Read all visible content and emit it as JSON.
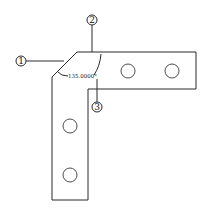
{
  "drawing": {
    "type": "L-bracket plate with chamfered outer corner",
    "dimension": {
      "label": "135.0000°",
      "kind": "angular"
    },
    "callouts": [
      {
        "id": "1",
        "label": "1",
        "target": "chamfer-edge"
      },
      {
        "id": "2",
        "label": "2",
        "target": "top-edge"
      },
      {
        "id": "3",
        "label": "3",
        "target": "angle-dimension"
      }
    ],
    "holes": [
      {
        "cx": 128,
        "cy": 71,
        "r": 7
      },
      {
        "cx": 172,
        "cy": 71,
        "r": 7
      },
      {
        "cx": 70,
        "cy": 126,
        "r": 7
      },
      {
        "cx": 70,
        "cy": 175,
        "r": 7
      }
    ],
    "colors": {
      "line": "#2a2a2a",
      "background": "#ffffff"
    }
  }
}
